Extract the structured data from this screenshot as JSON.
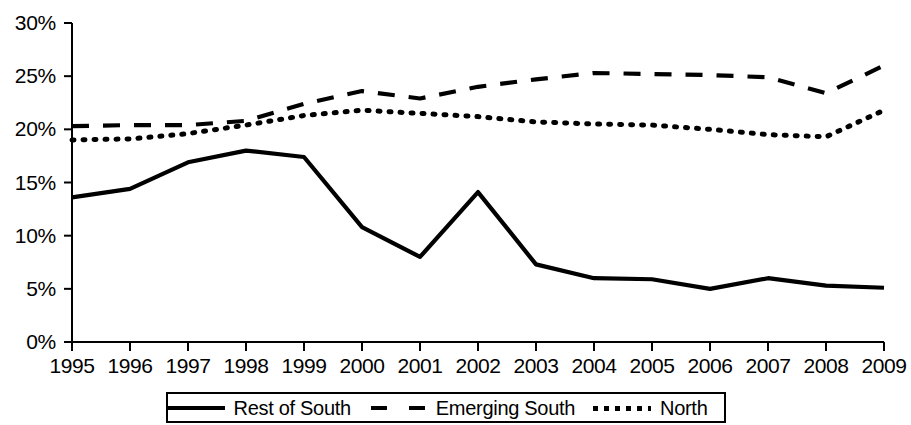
{
  "chart_data": {
    "type": "line",
    "title": "",
    "xlabel": "",
    "ylabel": "",
    "x": [
      1995,
      1996,
      1997,
      1998,
      1999,
      2000,
      2001,
      2002,
      2003,
      2004,
      2005,
      2006,
      2007,
      2008,
      2009
    ],
    "categories": [
      "1995",
      "1996",
      "1997",
      "1998",
      "1999",
      "2000",
      "2001",
      "2002",
      "2003",
      "2004",
      "2005",
      "2006",
      "2007",
      "2008",
      "2009"
    ],
    "ylim": [
      0,
      30
    ],
    "ytick_labels": [
      "0%",
      "5%",
      "10%",
      "15%",
      "20%",
      "25%",
      "30%"
    ],
    "ytick_values": [
      0,
      5,
      10,
      15,
      20,
      25,
      30
    ],
    "grid": false,
    "legend_position": "bottom",
    "series": [
      {
        "name": "Rest of South",
        "style": "solid",
        "color": "#000000",
        "values": [
          13.6,
          14.4,
          16.9,
          18.0,
          17.4,
          10.8,
          8.0,
          14.1,
          7.3,
          6.0,
          5.9,
          5.0,
          6.0,
          5.3,
          5.1
        ]
      },
      {
        "name": "Emerging South",
        "style": "dashed",
        "color": "#000000",
        "values": [
          20.3,
          20.4,
          20.4,
          20.8,
          22.4,
          23.6,
          22.9,
          24.0,
          24.7,
          25.3,
          25.2,
          25.1,
          24.9,
          23.4,
          26.0
        ]
      },
      {
        "name": "North",
        "style": "dotted",
        "color": "#000000",
        "values": [
          19.0,
          19.1,
          19.6,
          20.4,
          21.3,
          21.8,
          21.5,
          21.2,
          20.7,
          20.5,
          20.4,
          20.0,
          19.5,
          19.3,
          21.8
        ]
      }
    ]
  },
  "legend": {
    "items": [
      {
        "label": "Rest of South",
        "style": "solid"
      },
      {
        "label": "Emerging South",
        "style": "dashed"
      },
      {
        "label": "North",
        "style": "dotted"
      }
    ]
  }
}
